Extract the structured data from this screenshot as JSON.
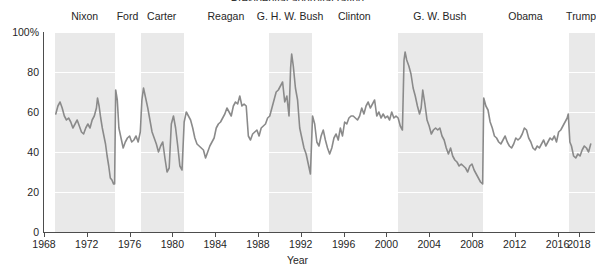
{
  "figure": {
    "clipped_top_title": "Presidential approval rating",
    "xlabel": "Year",
    "background_color": "#ffffff",
    "band_color": "#e9e9e9",
    "line_color": "#8a8a8a",
    "axis_color": "#4d4d4d",
    "grid_color": "#ffffff"
  },
  "chart_data": {
    "type": "line",
    "title": "",
    "xlabel": "Year",
    "ylabel": "",
    "xlim": [
      1968,
      2019.5
    ],
    "ylim": [
      0,
      100
    ],
    "grid": true,
    "legend": "none",
    "ytick_labels": [
      "0",
      "20",
      "40",
      "60",
      "80",
      "100%"
    ],
    "ytick_values": [
      0,
      20,
      40,
      60,
      80,
      100
    ],
    "xtick_labels": [
      "1968",
      "1972",
      "1976",
      "1980",
      "1984",
      "1988",
      "1992",
      "1996",
      "2000",
      "2004",
      "2008",
      "2012",
      "2016",
      "2018"
    ],
    "xtick_values": [
      1968,
      1972,
      1976,
      1980,
      1984,
      1988,
      1992,
      1996,
      2000,
      2004,
      2008,
      2012,
      2016,
      2018
    ],
    "shaded_terms": [
      {
        "label": "Nixon",
        "start": 1969.05,
        "end": 1974.62,
        "shaded": true,
        "label_x": 1971.8
      },
      {
        "label": "Ford",
        "start": 1974.62,
        "end": 1977.05,
        "shaded": false,
        "label_x": 1975.8
      },
      {
        "label": "Carter",
        "start": 1977.05,
        "end": 1981.05,
        "shaded": true,
        "label_x": 1979.0
      },
      {
        "label": "Reagan",
        "start": 1981.05,
        "end": 1989.05,
        "shaded": false,
        "label_x": 1985.0
      },
      {
        "label": "G. H. W. Bush",
        "start": 1989.05,
        "end": 1993.05,
        "shaded": true,
        "label_x": 1991.0
      },
      {
        "label": "Clinton",
        "start": 1993.05,
        "end": 2001.05,
        "shaded": false,
        "label_x": 1997.0
      },
      {
        "label": "G. W. Bush",
        "start": 2001.05,
        "end": 2009.05,
        "shaded": true,
        "label_x": 2005.0
      },
      {
        "label": "Obama",
        "start": 2009.05,
        "end": 2017.05,
        "shaded": false,
        "label_x": 2013.0
      },
      {
        "label": "Trump",
        "start": 2017.05,
        "end": 2019.5,
        "shaded": true,
        "label_x": 2018.2
      }
    ],
    "series": [
      {
        "name": "Approval rating",
        "units": "percent",
        "x": [
          1969.1,
          1969.3,
          1969.5,
          1969.7,
          1969.9,
          1970.1,
          1970.3,
          1970.5,
          1970.7,
          1970.9,
          1971.1,
          1971.3,
          1971.5,
          1971.7,
          1971.9,
          1972.1,
          1972.3,
          1972.5,
          1972.7,
          1972.9,
          1973.0,
          1973.15,
          1973.3,
          1973.45,
          1973.6,
          1973.75,
          1973.9,
          1974.05,
          1974.2,
          1974.35,
          1974.5,
          1974.6,
          1974.7,
          1974.85,
          1975.0,
          1975.2,
          1975.4,
          1975.6,
          1975.8,
          1976.0,
          1976.2,
          1976.4,
          1976.6,
          1976.8,
          1977.0,
          1977.15,
          1977.3,
          1977.5,
          1977.7,
          1977.9,
          1978.1,
          1978.3,
          1978.5,
          1978.7,
          1978.9,
          1979.1,
          1979.3,
          1979.5,
          1979.7,
          1979.9,
          1980.1,
          1980.3,
          1980.5,
          1980.7,
          1980.9,
          1981.1,
          1981.3,
          1981.5,
          1981.7,
          1981.9,
          1982.1,
          1982.3,
          1982.5,
          1982.7,
          1982.9,
          1983.1,
          1983.3,
          1983.5,
          1983.7,
          1983.9,
          1984.1,
          1984.3,
          1984.5,
          1984.7,
          1984.9,
          1985.1,
          1985.3,
          1985.5,
          1985.7,
          1985.9,
          1986.1,
          1986.3,
          1986.5,
          1986.7,
          1986.9,
          1987.1,
          1987.3,
          1987.5,
          1987.7,
          1987.9,
          1988.1,
          1988.3,
          1988.5,
          1988.7,
          1988.9,
          1989.1,
          1989.3,
          1989.5,
          1989.7,
          1989.9,
          1990.1,
          1990.3,
          1990.5,
          1990.7,
          1990.9,
          1991.05,
          1991.15,
          1991.3,
          1991.5,
          1991.7,
          1991.9,
          1992.1,
          1992.3,
          1992.5,
          1992.7,
          1992.9,
          1993.1,
          1993.3,
          1993.5,
          1993.7,
          1993.9,
          1994.1,
          1994.3,
          1994.5,
          1994.7,
          1994.9,
          1995.1,
          1995.3,
          1995.5,
          1995.7,
          1995.9,
          1996.1,
          1996.3,
          1996.5,
          1996.7,
          1996.9,
          1997.1,
          1997.3,
          1997.5,
          1997.7,
          1997.9,
          1998.1,
          1998.3,
          1998.5,
          1998.7,
          1998.9,
          1999.1,
          1999.3,
          1999.5,
          1999.7,
          1999.9,
          2000.1,
          2000.3,
          2000.5,
          2000.7,
          2000.9,
          2001.1,
          2001.3,
          2001.5,
          2001.65,
          2001.75,
          2001.9,
          2002.1,
          2002.3,
          2002.5,
          2002.7,
          2002.9,
          2003.1,
          2003.25,
          2003.4,
          2003.6,
          2003.8,
          2004.0,
          2004.2,
          2004.4,
          2004.6,
          2004.8,
          2005.0,
          2005.2,
          2005.4,
          2005.6,
          2005.8,
          2006.0,
          2006.2,
          2006.4,
          2006.6,
          2006.8,
          2007.0,
          2007.2,
          2007.4,
          2007.6,
          2007.8,
          2008.0,
          2008.2,
          2008.4,
          2008.6,
          2008.8,
          2009.0,
          2009.1,
          2009.3,
          2009.5,
          2009.7,
          2009.9,
          2010.1,
          2010.3,
          2010.5,
          2010.7,
          2010.9,
          2011.1,
          2011.3,
          2011.5,
          2011.7,
          2011.9,
          2012.1,
          2012.3,
          2012.5,
          2012.7,
          2012.9,
          2013.1,
          2013.3,
          2013.5,
          2013.7,
          2013.9,
          2014.1,
          2014.3,
          2014.5,
          2014.7,
          2014.9,
          2015.1,
          2015.3,
          2015.5,
          2015.7,
          2015.9,
          2016.1,
          2016.3,
          2016.5,
          2016.7,
          2016.9,
          2017.0,
          2017.15,
          2017.3,
          2017.5,
          2017.7,
          2017.9,
          2018.1,
          2018.3,
          2018.5,
          2018.7,
          2018.9,
          2019.1
        ],
        "y": [
          59,
          63,
          65,
          62,
          58,
          56,
          57,
          55,
          52,
          54,
          56,
          53,
          50,
          49,
          52,
          54,
          52,
          56,
          58,
          62,
          67,
          63,
          57,
          52,
          48,
          44,
          38,
          33,
          27,
          26,
          24,
          24,
          71,
          66,
          52,
          47,
          42,
          45,
          47,
          48,
          45,
          46,
          48,
          45,
          50,
          66,
          72,
          67,
          62,
          56,
          50,
          47,
          44,
          40,
          43,
          45,
          37,
          30,
          32,
          54,
          58,
          52,
          43,
          33,
          31,
          55,
          60,
          58,
          56,
          52,
          47,
          44,
          43,
          42,
          41,
          37,
          40,
          43,
          45,
          47,
          52,
          54,
          55,
          57,
          59,
          62,
          60,
          58,
          63,
          65,
          64,
          68,
          63,
          64,
          63,
          48,
          46,
          49,
          50,
          51,
          48,
          52,
          53,
          54,
          57,
          58,
          62,
          66,
          70,
          71,
          73,
          75,
          65,
          68,
          58,
          82,
          89,
          83,
          72,
          66,
          52,
          47,
          42,
          39,
          34,
          29,
          58,
          54,
          45,
          43,
          48,
          51,
          46,
          42,
          39,
          42,
          47,
          49,
          46,
          52,
          48,
          55,
          54,
          57,
          58,
          58,
          57,
          56,
          58,
          62,
          59,
          63,
          65,
          62,
          64,
          66,
          58,
          60,
          57,
          59,
          57,
          58,
          56,
          60,
          57,
          58,
          57,
          53,
          51,
          86,
          90,
          86,
          83,
          79,
          72,
          68,
          63,
          59,
          62,
          71,
          64,
          56,
          53,
          49,
          51,
          52,
          51,
          52,
          48,
          46,
          42,
          39,
          42,
          38,
          36,
          35,
          33,
          34,
          33,
          32,
          30,
          33,
          34,
          31,
          29,
          27,
          25,
          24,
          67,
          63,
          61,
          55,
          52,
          48,
          47,
          45,
          44,
          46,
          48,
          45,
          43,
          42,
          44,
          47,
          46,
          47,
          49,
          52,
          51,
          47,
          45,
          42,
          41,
          43,
          42,
          44,
          46,
          43,
          45,
          47,
          46,
          48,
          45,
          50,
          51,
          53,
          55,
          57,
          59,
          45,
          43,
          38,
          37,
          39,
          38,
          41,
          43,
          42,
          40,
          44
        ]
      }
    ],
    "annotations": [
      {
        "text": "Nixon resignation trough",
        "approx_value": 24,
        "year": 1974.5
      },
      {
        "text": "Gulf War peak",
        "approx_value": 89,
        "year": 1991.15
      },
      {
        "text": "Post-9/11 peak",
        "approx_value": 90,
        "year": 2001.75
      }
    ]
  }
}
